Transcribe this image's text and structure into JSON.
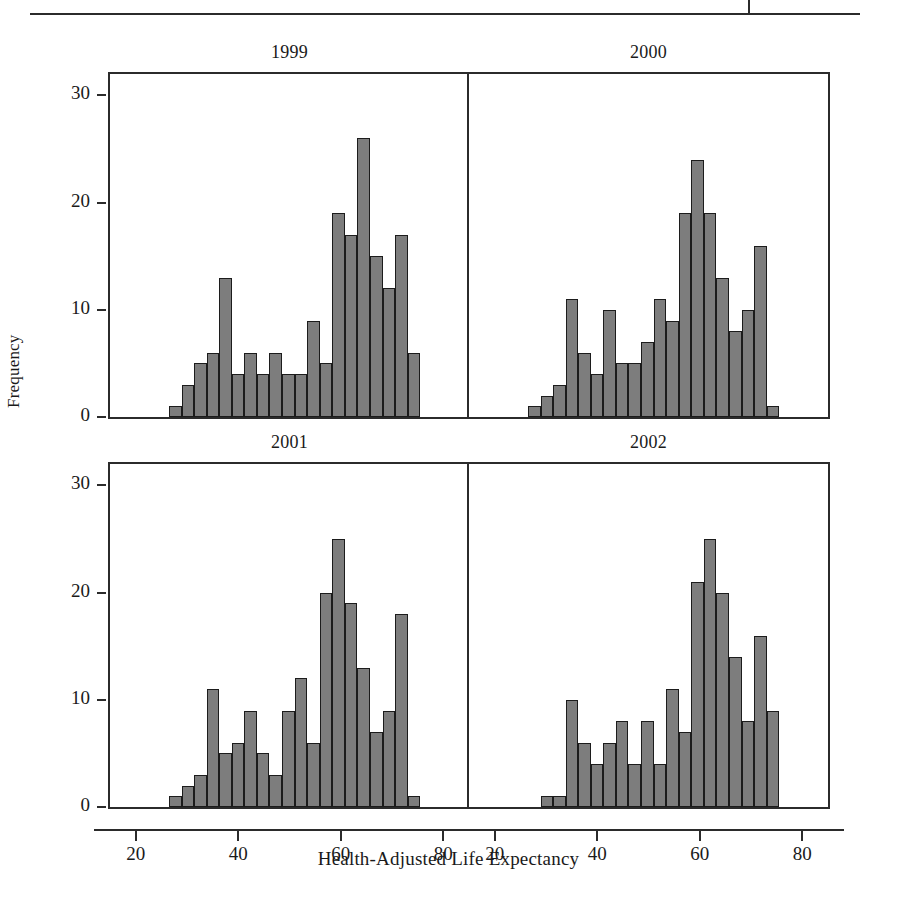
{
  "figure": {
    "ylabel": "Frequency",
    "xlabel": "Health-Adjusted Life Expectancy",
    "bar_color": "#7d7d7d",
    "bar_edge_color": "#1c1c1c",
    "axis_color": "#2b2b2b",
    "background": "#ffffff",
    "bottom_caption": ""
  },
  "axes": {
    "y_ticks": [
      "0",
      "10",
      "20",
      "30"
    ],
    "y_tick_values": [
      0,
      10,
      20,
      30
    ],
    "x_ticks": [
      "20",
      "40",
      "60",
      "80"
    ],
    "x_tick_values": [
      20,
      40,
      60,
      80
    ],
    "ylim": [
      0,
      32
    ],
    "xlim": [
      15,
      85
    ]
  },
  "chart_data": [
    {
      "type": "bar",
      "title": "1999",
      "xlabel": "Health-Adjusted Life Expectancy",
      "ylabel": "Frequency",
      "ylim": [
        0,
        32
      ],
      "xlim": [
        15,
        85
      ],
      "grid": false,
      "bin_width": 2.45,
      "bin_starts": [
        26.5,
        28.95,
        31.4,
        33.85,
        36.3,
        38.75,
        41.2,
        43.65,
        46.1,
        48.55,
        51.0,
        53.45,
        55.9,
        58.35,
        60.8,
        63.25,
        65.7,
        68.15,
        70.6,
        73.05
      ],
      "categories": [
        "26.5",
        "29",
        "31.4",
        "33.9",
        "36.3",
        "38.8",
        "41.2",
        "43.7",
        "46.1",
        "48.6",
        "51",
        "53.5",
        "55.9",
        "58.4",
        "60.8",
        "63.3",
        "65.7",
        "68.2",
        "70.6",
        "73.1"
      ],
      "values": [
        1,
        3,
        5,
        6,
        13,
        4,
        6,
        4,
        6,
        4,
        4,
        9,
        5,
        19,
        17,
        26,
        15,
        12,
        17,
        6
      ]
    },
    {
      "type": "bar",
      "title": "2000",
      "xlabel": "Health-Adjusted Life Expectancy",
      "ylabel": "Frequency",
      "ylim": [
        0,
        32
      ],
      "xlim": [
        15,
        85
      ],
      "grid": false,
      "bin_width": 2.45,
      "bin_starts": [
        26.5,
        28.95,
        31.4,
        33.85,
        36.3,
        38.75,
        41.2,
        43.65,
        46.1,
        48.55,
        51.0,
        53.45,
        55.9,
        58.35,
        60.8,
        63.25,
        65.7,
        68.15,
        70.6,
        73.05
      ],
      "categories": [
        "26.5",
        "29",
        "31.4",
        "33.9",
        "36.3",
        "38.8",
        "41.2",
        "43.7",
        "46.1",
        "48.6",
        "51",
        "53.5",
        "55.9",
        "58.4",
        "60.8",
        "63.3",
        "65.7",
        "68.2",
        "70.6",
        "73.1"
      ],
      "values": [
        1,
        2,
        3,
        11,
        6,
        4,
        10,
        5,
        5,
        7,
        11,
        9,
        19,
        24,
        19,
        13,
        8,
        10,
        16,
        1
      ]
    },
    {
      "type": "bar",
      "title": "2001",
      "xlabel": "Health-Adjusted Life Expectancy",
      "ylabel": "Frequency",
      "ylim": [
        0,
        32
      ],
      "xlim": [
        15,
        85
      ],
      "grid": false,
      "bin_width": 2.45,
      "bin_starts": [
        26.5,
        28.95,
        31.4,
        33.85,
        36.3,
        38.75,
        41.2,
        43.65,
        46.1,
        48.55,
        51.0,
        53.45,
        55.9,
        58.35,
        60.8,
        63.25,
        65.7,
        68.15,
        70.6,
        73.05
      ],
      "categories": [
        "26.5",
        "29",
        "31.4",
        "33.9",
        "36.3",
        "38.8",
        "41.2",
        "43.7",
        "46.1",
        "48.6",
        "51",
        "53.5",
        "55.9",
        "58.4",
        "60.8",
        "63.3",
        "65.7",
        "68.2",
        "70.6",
        "73.1"
      ],
      "values": [
        1,
        2,
        3,
        11,
        5,
        6,
        9,
        5,
        3,
        9,
        12,
        6,
        20,
        25,
        19,
        13,
        7,
        9,
        18,
        1
      ]
    },
    {
      "type": "bar",
      "title": "2002",
      "xlabel": "Health-Adjusted Life Expectancy",
      "ylabel": "Frequency",
      "ylim": [
        0,
        32
      ],
      "xlim": [
        15,
        85
      ],
      "grid": false,
      "bin_width": 2.45,
      "bin_starts": [
        28.95,
        31.4,
        33.85,
        36.3,
        38.75,
        41.2,
        43.65,
        46.1,
        48.55,
        51.0,
        53.45,
        55.9,
        58.35,
        60.8,
        63.25,
        65.7,
        68.15,
        70.6,
        73.05
      ],
      "categories": [
        "29",
        "31.4",
        "33.9",
        "36.3",
        "38.8",
        "41.2",
        "43.7",
        "46.1",
        "48.6",
        "51",
        "53.5",
        "55.9",
        "58.4",
        "60.8",
        "63.3",
        "65.7",
        "68.2",
        "70.6",
        "73.1"
      ],
      "values": [
        1,
        1,
        10,
        6,
        4,
        6,
        8,
        4,
        8,
        4,
        11,
        7,
        21,
        25,
        20,
        14,
        8,
        16,
        9
      ]
    }
  ]
}
